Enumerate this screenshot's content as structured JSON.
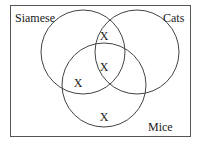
{
  "diagram": {
    "type": "venn",
    "sets": [
      {
        "label": "Siamese",
        "cx": 83,
        "cy": 52,
        "r": 42
      },
      {
        "label": "Cats",
        "cx": 137,
        "cy": 52,
        "r": 42
      },
      {
        "label": "Mice",
        "cx": 104,
        "cy": 85,
        "r": 42
      }
    ],
    "marks": [
      {
        "text": "X",
        "region": "Siamese ∩ Cats only",
        "x": 104,
        "y": 40
      },
      {
        "text": "X",
        "region": "Siamese ∩ Cats ∩ Mice",
        "x": 104,
        "y": 71
      },
      {
        "text": "X",
        "region": "Siamese ∩ Mice only",
        "x": 78,
        "y": 86
      },
      {
        "text": "X",
        "region": "Mice only",
        "x": 104,
        "y": 120
      }
    ],
    "colors": {
      "stroke": "#444444",
      "text": "#1a1a1a",
      "background": "#ffffff"
    }
  }
}
